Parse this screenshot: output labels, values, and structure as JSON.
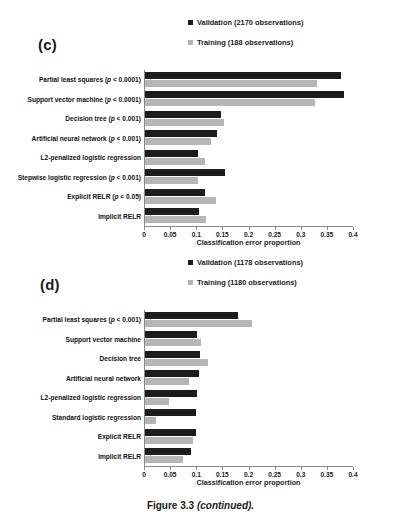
{
  "figure": {
    "caption_main": "Figure 3.3",
    "caption_continued": "(continued)."
  },
  "panels": [
    {
      "letter": "(c)",
      "legend": [
        {
          "label": "Validation (2170 observations)",
          "color": "#1c1c1c",
          "swatch": "validation-swatch"
        },
        {
          "label": "Training (188 observations)",
          "color": "#b6b6b6",
          "swatch": "training-swatch"
        }
      ],
      "xlabel": "Classification error proportion",
      "ticks": [
        "0",
        "0.05",
        "0.1",
        "0.15",
        "0.2",
        "0.25",
        "0.3",
        "0.35",
        "0.4"
      ],
      "categories": [
        "Partial least squares (p < 0.0001)",
        "Support vector machine (p < 0.0001)",
        "Decision tree (p < 0.001)",
        "Artificial neural network (p < 0.001)",
        "L2-penalized logistic regression",
        "Stepwise logistic regression (p < 0.001)",
        "Explicit RELR (p < 0.05)",
        "Implicit RELR"
      ]
    },
    {
      "letter": "(d)",
      "legend": [
        {
          "label": "Validation (1178 observations)",
          "color": "#1c1c1c",
          "swatch": "validation-swatch"
        },
        {
          "label": "Training (1180 observations)",
          "color": "#b6b6b6",
          "swatch": "training-swatch"
        }
      ],
      "xlabel": "Classification error proportion",
      "ticks": [
        "0",
        "0.05",
        "0.1",
        "0.15",
        "0.2",
        "0.25",
        "0.3",
        "0.35",
        "0.4"
      ],
      "categories": [
        "Partial least squares (p < 0.001)",
        "Support vector machine",
        "Decision tree",
        "Artificial neural network",
        "L2-penalized logistic regression",
        "Standard logistic regression",
        "Explicit RELR",
        "Implicit RELR"
      ]
    }
  ],
  "chart_data": [
    {
      "type": "bar",
      "title": "(c)",
      "orientation": "horizontal",
      "xlabel": "Classification error proportion",
      "ylabel": "",
      "xlim": [
        0,
        0.4
      ],
      "xticks": [
        0,
        0.05,
        0.1,
        0.15,
        0.2,
        0.25,
        0.3,
        0.35,
        0.4
      ],
      "grid": false,
      "legend_position": "top-right",
      "categories": [
        "Partial least squares (p < 0.0001)",
        "Support vector machine (p < 0.0001)",
        "Decision tree (p < 0.001)",
        "Artificial neural network (p < 0.001)",
        "L2-penalized logistic regression",
        "Stepwise logistic regression (p < 0.001)",
        "Explicit RELR (p < 0.05)",
        "Implicit RELR"
      ],
      "series": [
        {
          "name": "Validation (2170 observations)",
          "color": "#1c1c1c",
          "values": [
            0.376,
            0.382,
            0.147,
            0.138,
            0.102,
            0.153,
            0.116,
            0.103
          ]
        },
        {
          "name": "Training (188 observations)",
          "color": "#b6b6b6",
          "values": [
            0.33,
            0.326,
            0.152,
            0.126,
            0.115,
            0.101,
            0.136,
            0.117
          ]
        }
      ]
    },
    {
      "type": "bar",
      "title": "(d)",
      "orientation": "horizontal",
      "xlabel": "Classification error proportion",
      "ylabel": "",
      "xlim": [
        0,
        0.4
      ],
      "xticks": [
        0,
        0.05,
        0.1,
        0.15,
        0.2,
        0.25,
        0.3,
        0.35,
        0.4
      ],
      "grid": false,
      "legend_position": "top-right",
      "categories": [
        "Partial least squares (p < 0.001)",
        "Support vector machine",
        "Decision tree",
        "Artificial neural network",
        "L2-penalized logistic regression",
        "Standard logistic regression",
        "Explicit RELR",
        "Implicit RELR"
      ],
      "series": [
        {
          "name": "Validation (1178 observations)",
          "color": "#1c1c1c",
          "values": [
            0.179,
            0.1,
            0.105,
            0.103,
            0.1,
            0.098,
            0.099,
            0.089
          ]
        },
        {
          "name": "Training (1180 observations)",
          "color": "#b6b6b6",
          "values": [
            0.206,
            0.108,
            0.121,
            0.084,
            0.047,
            0.022,
            0.093,
            0.073
          ]
        }
      ]
    }
  ]
}
